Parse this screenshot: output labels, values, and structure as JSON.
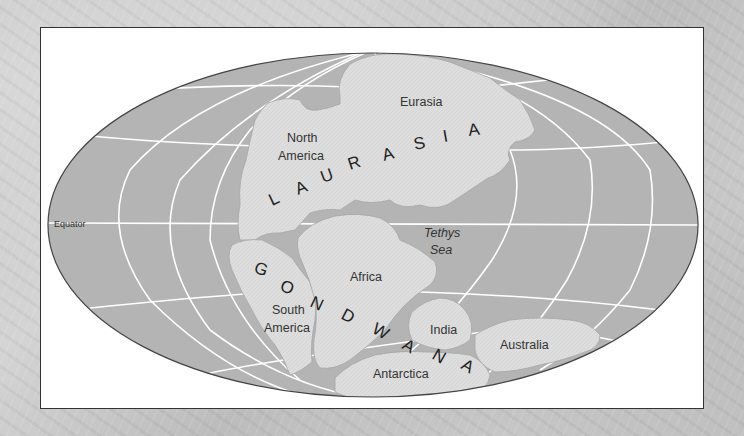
{
  "map": {
    "title": "Pangaea",
    "colors": {
      "ocean": "#b4b4b4",
      "land": "#dcdcdc",
      "grid": "#ffffff",
      "outline": "#444444",
      "text": "#333333"
    },
    "supercontinents": [
      {
        "name": "LAURASIA",
        "letters": [
          "L",
          "A",
          "U",
          "R",
          "A",
          "S",
          "I",
          "A"
        ]
      },
      {
        "name": "GONDWANA",
        "letters": [
          "G",
          "O",
          "N",
          "D",
          "W",
          "A",
          "N",
          "A"
        ]
      }
    ],
    "labels": {
      "eurasia": "Eurasia",
      "north_america_1": "North",
      "north_america_2": "America",
      "africa": "Africa",
      "south_america_1": "South",
      "south_america_2": "America",
      "india": "India",
      "antarctica": "Antarctica",
      "australia": "Australia",
      "tethys_1": "Tethys",
      "tethys_2": "Sea",
      "equator": "Equator"
    }
  }
}
